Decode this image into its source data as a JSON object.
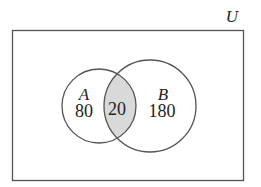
{
  "diagram": {
    "type": "venn",
    "universe_label": "U",
    "sets": [
      {
        "name": "A",
        "only_count": "80"
      },
      {
        "name": "B",
        "only_count": "180"
      }
    ],
    "intersection_count": "20",
    "colors": {
      "stroke": "#555555",
      "intersection_fill": "#d9d9d9",
      "background": "#ffffff",
      "text": "#222222"
    }
  }
}
